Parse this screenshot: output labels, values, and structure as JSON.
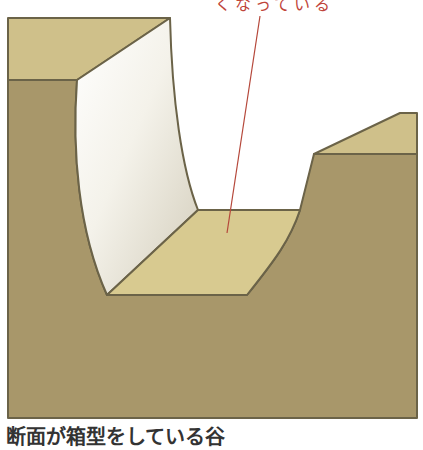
{
  "annotation": {
    "text": "くなっている",
    "line_color": "#b5473a",
    "text_color": "#c0453a"
  },
  "caption": {
    "text": "断面が箱型をしている谷"
  },
  "colors": {
    "top_surface": "#cfc08a",
    "front_face": "#a8976a",
    "floor": "#d8ca90",
    "lit_wall_light": "#ffffff",
    "lit_wall_dark": "#d3cdbb",
    "outline": "#6b6348",
    "background": "#ffffff"
  },
  "diagram": {
    "parts": [
      "left-plateau",
      "left-valley-wall",
      "valley-floor",
      "right-valley-wall",
      "right-plateau",
      "front-cross-section"
    ]
  }
}
